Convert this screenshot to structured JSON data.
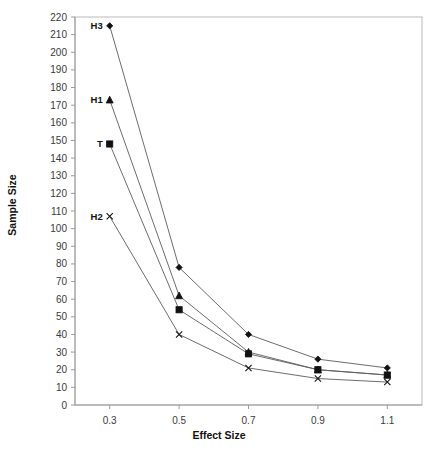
{
  "chart_data": {
    "type": "line",
    "title": "",
    "xlabel": "Effect Size",
    "ylabel": "Sample Size",
    "x": [
      0.3,
      0.5,
      0.7,
      0.9,
      1.1
    ],
    "xtick_labels": [
      "0.3",
      "0.5",
      "0.7",
      "0.9",
      "1.1"
    ],
    "xlim": [
      0.2,
      1.2
    ],
    "ylim": [
      0,
      220
    ],
    "ytick_labels": [
      "0",
      "10",
      "20",
      "30",
      "40",
      "50",
      "60",
      "70",
      "80",
      "90",
      "100",
      "110",
      "120",
      "130",
      "140",
      "150",
      "160",
      "170",
      "180",
      "190",
      "200",
      "210",
      "220"
    ],
    "ytick_values": [
      0,
      10,
      20,
      30,
      40,
      50,
      60,
      70,
      80,
      90,
      100,
      110,
      120,
      130,
      140,
      150,
      160,
      170,
      180,
      190,
      200,
      210,
      220
    ],
    "grid": false,
    "legend": "inline-labels-at-first-point",
    "series": [
      {
        "name": "H3",
        "label": "H3",
        "marker": "diamond",
        "values": [
          215,
          78,
          40,
          26,
          21
        ]
      },
      {
        "name": "H1",
        "label": "H1",
        "marker": "triangle",
        "values": [
          173,
          62,
          30,
          20,
          17
        ]
      },
      {
        "name": "T",
        "label": "T",
        "marker": "square",
        "values": [
          148,
          54,
          29,
          20,
          17
        ]
      },
      {
        "name": "H2",
        "label": "H2",
        "marker": "x",
        "values": [
          107,
          40,
          21,
          15,
          13
        ]
      }
    ]
  },
  "colors": {
    "line": "#5b5b5b",
    "marker": "#111111",
    "border": "#b9b9b9",
    "axis": "#9a9a9a",
    "text": "#3a3a3a",
    "background": "#ffffff"
  }
}
